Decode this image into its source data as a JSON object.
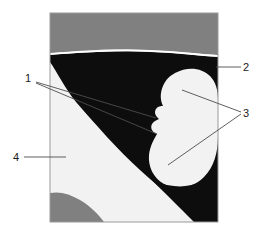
{
  "figure": {
    "type": "labeled-cross-section-diagram",
    "panel": {
      "x": 50,
      "y": 13,
      "width": 168,
      "height": 209,
      "border_color": "#9a9a9a"
    },
    "regions": [
      {
        "name": "upper-gray-band",
        "color": "#808080",
        "description": "gray band across the top of the panel"
      },
      {
        "name": "black-matrix",
        "color": "#0d0d0d",
        "description": "large dark region filling the middle and right of the panel"
      },
      {
        "name": "white-separator-line",
        "color": "#ffffff",
        "description": "thin light line separating the gray band from the black region"
      },
      {
        "name": "light-kidney-inclusion",
        "color": "#f2f2f2",
        "description": "two-lobed light bean-shaped inclusion on the right side"
      },
      {
        "name": "light-lower-left-region",
        "color": "#f2f2f2",
        "description": "large light region occupying the lower-left, bounded by a diagonal curve"
      },
      {
        "name": "lower-left-gray-region",
        "color": "#808080",
        "description": "gray lobe at the bottom-left corner"
      }
    ],
    "labels": [
      {
        "id": "label-1",
        "text": "1",
        "text_x": 28,
        "text_y": 82,
        "leaders": [
          {
            "x1": 36,
            "y1": 82,
            "x2": 156,
            "y2": 118
          },
          {
            "x1": 36,
            "y1": 83,
            "x2": 157,
            "y2": 134
          }
        ],
        "points_to": "light-kidney-inclusion-notch"
      },
      {
        "id": "label-2",
        "text": "2",
        "text_x": 246,
        "text_y": 71,
        "leaders": [
          {
            "x1": 216,
            "y1": 67,
            "x2": 241,
            "y2": 67
          }
        ],
        "points_to": "black-matrix"
      },
      {
        "id": "label-3",
        "text": "3",
        "text_x": 246,
        "text_y": 117,
        "leaders": [
          {
            "x1": 241,
            "y1": 112,
            "x2": 182,
            "y2": 90
          },
          {
            "x1": 241,
            "y1": 114,
            "x2": 168,
            "y2": 165
          }
        ],
        "points_to": "light-kidney-inclusion"
      },
      {
        "id": "label-4",
        "text": "4",
        "text_x": 16,
        "text_y": 161,
        "leaders": [
          {
            "x1": 24,
            "y1": 157,
            "x2": 66,
            "y2": 157
          }
        ],
        "points_to": "light-lower-left-region"
      }
    ]
  }
}
